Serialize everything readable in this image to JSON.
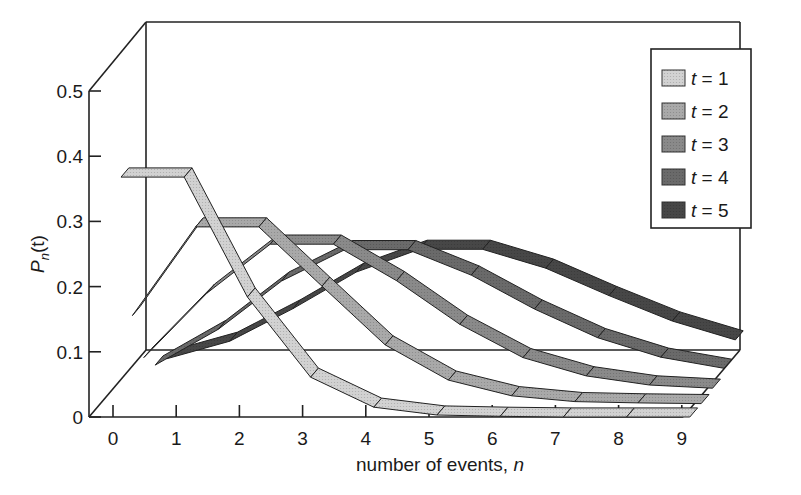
{
  "chart_data": {
    "type": "line",
    "style": "3d-ribbon",
    "title": "",
    "xlabel": "number of events, ",
    "xlabel_italic": "n",
    "ylabel_main": "P",
    "ylabel_sub": "n",
    "ylabel_arg": "(t)",
    "x": [
      0,
      1,
      2,
      3,
      4,
      5,
      6,
      7,
      8,
      9
    ],
    "x_tick_labels": [
      "0",
      "1",
      "2",
      "3",
      "4",
      "5",
      "6",
      "7",
      "8",
      "9"
    ],
    "y_ticks": [
      0,
      0.1,
      0.2,
      0.3,
      0.4,
      0.5
    ],
    "y_tick_labels": [
      "0",
      "0.1",
      "0.2",
      "0.3",
      "0.4",
      "0.5"
    ],
    "ylim": [
      0,
      0.5
    ],
    "xlim": [
      0,
      9
    ],
    "grid": false,
    "legend_position": "top-right",
    "series": [
      {
        "name": "t = 1",
        "var": "t",
        "value": "1",
        "color": "#d2d2d2",
        "values": [
          0.368,
          0.368,
          0.184,
          0.061,
          0.015,
          0.003,
          0.001,
          0.0,
          0.0,
          0.0
        ]
      },
      {
        "name": "t = 2",
        "var": "t",
        "value": "2",
        "color": "#a9a9a9",
        "values": [
          0.135,
          0.271,
          0.271,
          0.18,
          0.09,
          0.036,
          0.012,
          0.003,
          0.001,
          0.0
        ]
      },
      {
        "name": "t = 3",
        "var": "t",
        "value": "3",
        "color": "#8a8a8a",
        "values": [
          0.05,
          0.149,
          0.224,
          0.224,
          0.168,
          0.101,
          0.05,
          0.022,
          0.008,
          0.003
        ]
      },
      {
        "name": "t = 4",
        "var": "t",
        "value": "4",
        "color": "#6a6a6a",
        "values": [
          0.018,
          0.073,
          0.147,
          0.195,
          0.195,
          0.156,
          0.104,
          0.06,
          0.03,
          0.013
        ]
      },
      {
        "name": "t = 5",
        "var": "t",
        "value": "5",
        "color": "#474747",
        "values": [
          0.007,
          0.034,
          0.084,
          0.14,
          0.175,
          0.175,
          0.146,
          0.104,
          0.065,
          0.036
        ]
      }
    ]
  }
}
